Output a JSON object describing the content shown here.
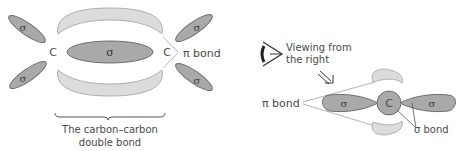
{
  "left_diagram": {
    "carbon_left": "C",
    "carbon_right": "C",
    "sigma_center": "σ",
    "sigma_lobes": [
      "σ",
      "σ",
      "σ",
      "σ"
    ],
    "pi_bond_label": "π bond",
    "caption_line1": "The carbon–carbon",
    "caption_line2": "double bond"
  },
  "right_diagram": {
    "viewing_line1": "Viewing from",
    "viewing_line2": "the right",
    "pi_bond_label": "π bond",
    "carbon": "C",
    "sigma_left": "σ",
    "sigma_right": "σ",
    "sigma_bond_label": "σ bond"
  },
  "colors": {
    "pi_fill": "#dcdcdc",
    "pi_stroke": "#b0b0b0",
    "sigma_fill": "#a9a9a9",
    "sigma_stroke": "#6e6e6e",
    "text": "#4a4a4a"
  }
}
